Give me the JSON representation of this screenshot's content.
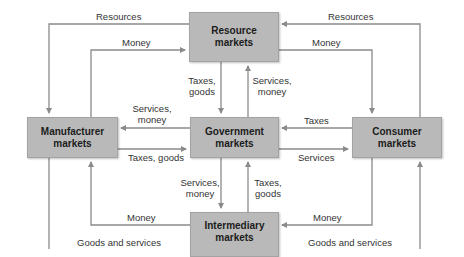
{
  "diagram": {
    "colors": {
      "box_fill": "#b9b9b9",
      "line": "#8a8a8a",
      "text": "#1c1c1c",
      "label": "#333333"
    },
    "nodes": {
      "resource": {
        "line1": "Resource",
        "line2": "markets"
      },
      "manufacturer": {
        "line1": "Manufacturer",
        "line2": "markets"
      },
      "government": {
        "line1": "Government",
        "line2": "markets"
      },
      "consumer": {
        "line1": "Consumer",
        "line2": "markets"
      },
      "intermediary": {
        "line1": "Intermediary",
        "line2": "markets"
      }
    },
    "flows": {
      "resources_left": "Resources",
      "money_left_top": "Money",
      "resources_right": "Resources",
      "money_right_top": "Money",
      "res_to_gov_1": "Taxes,",
      "res_to_gov_2": "goods",
      "gov_to_res_1": "Services,",
      "gov_to_res_2": "money",
      "gov_to_mfr_1": "Services,",
      "gov_to_mfr_2": "money",
      "mfr_to_gov": "Taxes, goods",
      "cons_to_gov": "Taxes",
      "gov_to_cons": "Services",
      "gov_to_int_1": "Services,",
      "gov_to_int_2": "money",
      "int_to_gov_1": "Taxes,",
      "int_to_gov_2": "goods",
      "money_left_bottom": "Money",
      "money_right_bottom": "Money",
      "goods_left": "Goods and services",
      "goods_right": "Goods and services"
    }
  }
}
